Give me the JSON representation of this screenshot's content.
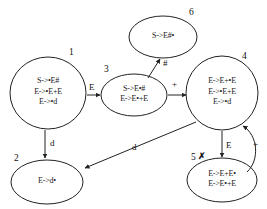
{
  "diagram": {
    "stroke_color": "#222222",
    "background_color": "#ffffff",
    "states": [
      {
        "id": "1",
        "number": "1",
        "items": [
          "S->•E#",
          "E->•E+E",
          "E->•d"
        ],
        "cx": 48,
        "cy": 93,
        "rx": 38,
        "ry": 36,
        "num_x": 69,
        "num_y": 47
      },
      {
        "id": "2",
        "number": "2",
        "items": [
          "E->d•"
        ],
        "cx": 47,
        "cy": 182,
        "rx": 36,
        "ry": 22,
        "num_x": 14,
        "num_y": 153
      },
      {
        "id": "3",
        "number": "3",
        "items": [
          "S->E•#",
          "E->E•+E"
        ],
        "cx": 134,
        "cy": 95,
        "rx": 33,
        "ry": 21,
        "num_x": 104,
        "num_y": 64
      },
      {
        "id": "4",
        "number": "4",
        "items": [
          "E->E+•E",
          "E->•E+E",
          "E->•d"
        ],
        "cx": 222,
        "cy": 93,
        "rx": 36,
        "ry": 37,
        "num_x": 242,
        "num_y": 51
      },
      {
        "id": "5",
        "number": "5",
        "items": [
          "E->E+E•",
          "E->E•+E"
        ],
        "cx": 222,
        "cy": 180,
        "rx": 35,
        "ry": 22,
        "num_x": 191,
        "num_y": 152,
        "mark": "✗",
        "mark_x": 198,
        "mark_y": 151
      },
      {
        "id": "6",
        "number": "6",
        "items": [
          "S->E#•"
        ],
        "cx": 163,
        "cy": 37,
        "rx": 34,
        "ry": 21,
        "num_x": 189,
        "num_y": 7
      }
    ],
    "edges": [
      {
        "id": "e1-3",
        "from": "1",
        "to": "3",
        "label": "E",
        "label_x": 89,
        "label_y": 82,
        "path": "M 87,95 L 100,95"
      },
      {
        "id": "e3-4",
        "from": "3",
        "to": "4",
        "label": "+",
        "label_x": 172,
        "label_y": 79,
        "path": "M 168,95 L 186,95"
      },
      {
        "id": "e3-6",
        "from": "3",
        "to": "6",
        "label": "#",
        "label_x": 163,
        "label_y": 58,
        "path": "M 148,78 L 160,59"
      },
      {
        "id": "e1-2",
        "from": "1",
        "to": "2",
        "label": "d",
        "label_x": 50,
        "label_y": 138,
        "path": "M 45,130 L 45,158"
      },
      {
        "id": "e4-2",
        "from": "4",
        "to": "2",
        "label": "d",
        "label_x": 132,
        "label_y": 142,
        "path": "M 196,122 L 85,168"
      },
      {
        "id": "e4-5",
        "from": "4",
        "to": "5",
        "label": "E",
        "label_x": 226,
        "label_y": 140,
        "path": "M 222,131 L 222,157"
      },
      {
        "id": "e5-4",
        "from": "5",
        "to": "4",
        "label": "+",
        "label_x": 253,
        "label_y": 139,
        "path": "M 247,172 C 260,160 258,135 243,126"
      }
    ]
  }
}
